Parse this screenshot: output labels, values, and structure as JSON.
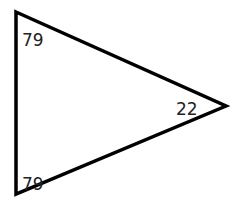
{
  "diagram": {
    "type": "triangle",
    "stroke_color": "#000000",
    "angles": [
      {
        "vertex": "top-left",
        "label": "79"
      },
      {
        "vertex": "bottom-left",
        "label": "79"
      },
      {
        "vertex": "right",
        "label": "22"
      }
    ]
  }
}
